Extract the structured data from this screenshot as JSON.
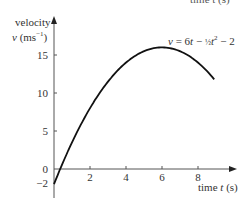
{
  "header_fragment": "time t (s)",
  "chart_data": {
    "type": "line",
    "title": "",
    "xlabel": "time t (s)",
    "ylabel_line1": "velocity",
    "ylabel_line2": "v (ms⁻¹)",
    "xlim": [
      0,
      10
    ],
    "ylim": [
      -2,
      17
    ],
    "grid": false,
    "legend": "none",
    "x_ticks": [
      2,
      4,
      6,
      8
    ],
    "x_tick_labels": [
      "2",
      "4",
      "6",
      "8"
    ],
    "y_ticks": [
      -2,
      0,
      5,
      10,
      15
    ],
    "y_tick_labels": [
      "−2",
      "0",
      "5",
      "10",
      "15"
    ],
    "annotation": "v = 6t − ½t² − 2",
    "series": [
      {
        "name": "v = 6t - 0.5t^2 - 2",
        "x": [
          0,
          1,
          2,
          3,
          4,
          5,
          6,
          7,
          8,
          8.9
        ],
        "values": [
          -2,
          3.5,
          8,
          11.5,
          14,
          15.5,
          16,
          15.5,
          14,
          11.8
        ]
      }
    ]
  }
}
